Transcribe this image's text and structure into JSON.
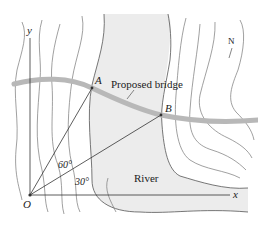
{
  "diagram": {
    "points": {
      "origin": {
        "label": "O",
        "x": 30,
        "y": 195
      },
      "A": {
        "label": "A",
        "x": 92,
        "y": 88
      },
      "B": {
        "label": "B",
        "x": 161,
        "y": 115
      }
    },
    "axes": {
      "x_label": "x",
      "y_label": "y"
    },
    "angles": [
      {
        "label": "60°",
        "description": "angle between y-axis and line OA"
      },
      {
        "label": "30°",
        "description": "angle between x-axis and line OB"
      }
    ],
    "labels": {
      "bridge": "Proposed bridge",
      "river": "River",
      "north": "N"
    },
    "colors": {
      "river_fill": "#ececec",
      "bridge": "#b8b8b8",
      "contour": "#6e6e6e",
      "line": "#333333"
    }
  }
}
